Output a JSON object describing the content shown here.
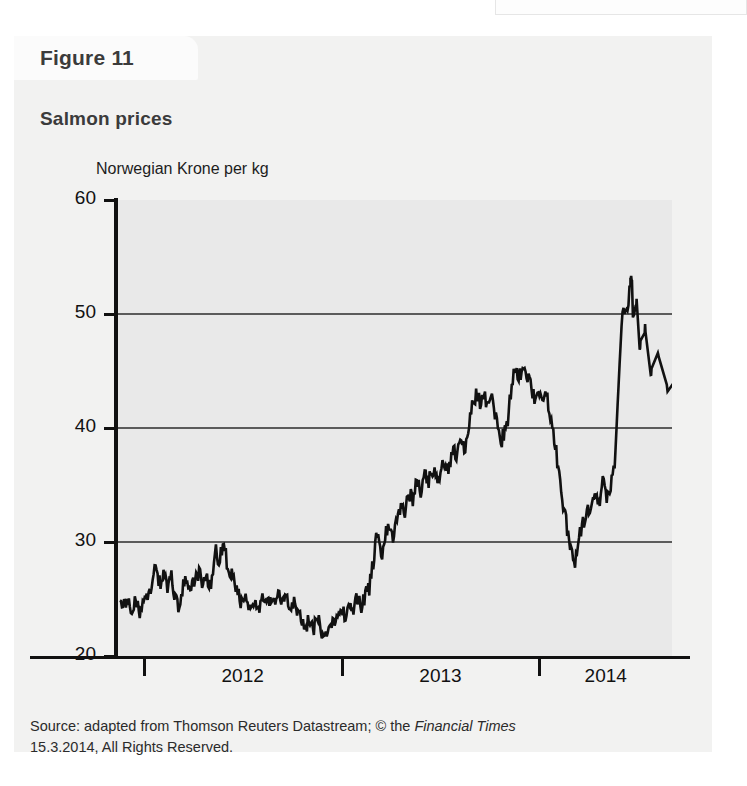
{
  "figure": {
    "tab_label": "Figure 11",
    "title": "Salmon prices"
  },
  "source": {
    "line1_pre": "Source: adapted from Thomson Reuters Datastream; © the ",
    "line1_italic": "Financial Times",
    "line2": "15.3.2014, All Rights Reserved."
  },
  "chart_data": {
    "type": "line",
    "title": "Salmon prices",
    "subtitle": "",
    "xlabel": "",
    "ylabel": "Norwegian Krone per kg",
    "ylim": [
      20,
      60
    ],
    "yticks": [
      20,
      30,
      40,
      50,
      60
    ],
    "ytick_labels": [
      "20",
      "30",
      "40",
      "50",
      "60"
    ],
    "xlim": [
      2011.62,
      2014.42
    ],
    "xtick_positions": [
      2011.75,
      2012.75,
      2013.75
    ],
    "xtick_labels": [
      "",
      "",
      ""
    ],
    "x_category_labels": [
      "2012",
      "2013",
      "2014"
    ],
    "grid": "horizontal",
    "gridlines": [
      30,
      40,
      50
    ],
    "legend": "none",
    "line_color": "#111111",
    "plot_background": "#e9e9e9",
    "series": [
      {
        "name": "Salmon price (NOK per kg)",
        "x": [
          2011.63,
          2011.65,
          2011.67,
          2011.69,
          2011.71,
          2011.73,
          2011.75,
          2011.77,
          2011.79,
          2011.81,
          2011.83,
          2011.85,
          2011.87,
          2011.89,
          2011.91,
          2011.93,
          2011.95,
          2011.97,
          2011.99,
          2012.01,
          2012.03,
          2012.05,
          2012.07,
          2012.09,
          2012.11,
          2012.13,
          2012.15,
          2012.17,
          2012.19,
          2012.21,
          2012.23,
          2012.25,
          2012.27,
          2012.29,
          2012.31,
          2012.33,
          2012.35,
          2012.37,
          2012.39,
          2012.41,
          2012.43,
          2012.45,
          2012.47,
          2012.49,
          2012.51,
          2012.53,
          2012.55,
          2012.57,
          2012.59,
          2012.61,
          2012.63,
          2012.65,
          2012.67,
          2012.69,
          2012.71,
          2012.73,
          2012.75,
          2012.77,
          2012.79,
          2012.81,
          2012.83,
          2012.85,
          2012.87,
          2012.89,
          2012.91,
          2012.93,
          2012.95,
          2012.97,
          2012.99,
          2013.01,
          2013.03,
          2013.05,
          2013.07,
          2013.09,
          2013.11,
          2013.13,
          2013.15,
          2013.17,
          2013.19,
          2013.21,
          2013.23,
          2013.25,
          2013.27,
          2013.29,
          2013.31,
          2013.33,
          2013.35,
          2013.37,
          2013.39,
          2013.41,
          2013.43,
          2013.45,
          2013.47,
          2013.49,
          2013.51,
          2013.53,
          2013.55,
          2013.57,
          2013.59,
          2013.61,
          2013.63,
          2013.65,
          2013.67,
          2013.69,
          2013.71,
          2013.73,
          2013.75,
          2013.77,
          2013.79,
          2013.81,
          2013.83,
          2013.85,
          2013.87,
          2013.89,
          2013.91,
          2013.93,
          2013.95,
          2013.97,
          2013.99,
          2014.01,
          2014.03,
          2014.05,
          2014.07,
          2014.09,
          2014.11,
          2014.13,
          2014.15,
          2014.17,
          2014.19,
          2014.21
        ],
        "y": [
          25.6,
          24.3,
          25.4,
          23.6,
          25.0,
          23.4,
          24.6,
          25.4,
          26.2,
          27.9,
          26.4,
          27.1,
          26.0,
          26.8,
          25.0,
          24.3,
          26.1,
          26.6,
          25.6,
          26.9,
          27.4,
          26.2,
          27.0,
          26.0,
          29.5,
          28.2,
          29.8,
          28.4,
          27.3,
          26.4,
          25.2,
          24.6,
          25.1,
          24.3,
          25.0,
          24.2,
          24.8,
          24.1,
          25.2,
          24.6,
          25.6,
          24.4,
          25.4,
          24.5,
          24.9,
          23.6,
          23.0,
          22.6,
          23.2,
          22.4,
          23.3,
          22.1,
          21.7,
          22.6,
          23.4,
          22.9,
          24.0,
          23.5,
          24.6,
          24.1,
          25.0,
          24.4,
          25.3,
          26.0,
          28.2,
          31.0,
          28.6,
          30.5,
          31.3,
          30.2,
          32.0,
          33.4,
          32.6,
          34.5,
          33.6,
          35.3,
          34.4,
          36.0,
          35.2,
          36.4,
          35.6,
          36.2,
          37.1,
          36.3,
          38.2,
          37.3,
          39.0,
          38.0,
          39.6,
          41.8,
          43.0,
          42.2,
          42.8,
          41.9,
          42.6,
          41.0,
          38.6,
          39.4,
          40.8,
          43.8,
          45.3,
          44.6,
          45.8,
          44.5,
          43.4,
          42.0,
          43.0,
          42.3,
          42.8,
          40.2,
          38.5,
          36.0,
          33.4,
          31.2,
          29.6,
          27.8,
          30.4,
          31.6,
          33.0,
          32.2,
          34.6,
          33.2,
          35.1,
          34.0,
          35.2,
          36.4,
          43.8,
          50.6,
          49.8,
          52.8
        ]
      }
    ],
    "annotations": [
      {
        "label": "2012 trough",
        "value": 21.7
      },
      {
        "label": "mid-2013 trough",
        "value": 27.8
      },
      {
        "label": "early-2014 peak",
        "value": 53.2
      },
      {
        "label": "final value",
        "value": 44.3
      }
    ]
  }
}
